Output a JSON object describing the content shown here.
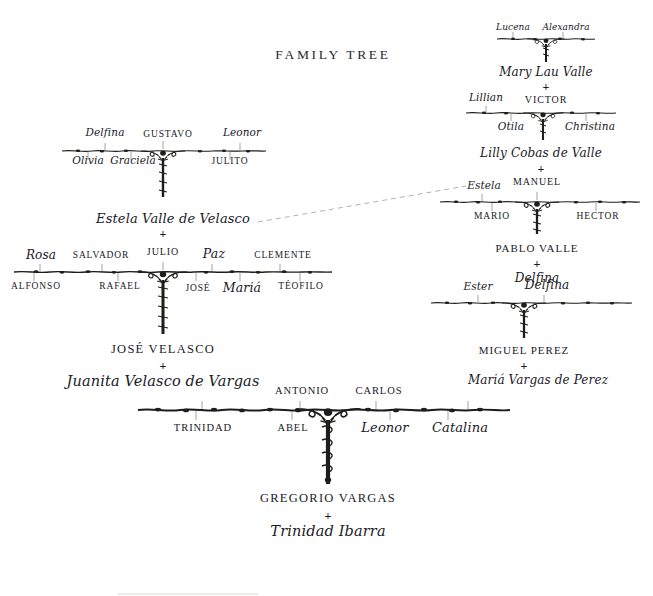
{
  "page": {
    "title": "FAMILY TREE",
    "background": "#ffffff",
    "ink": "#1d1d1b",
    "footer_rule": true
  },
  "family_tree": {
    "type": "genealogy",
    "title": "FAMILY TREE",
    "nodes": [
      {
        "id": "lucena-alexandra-branch",
        "style": "branch",
        "children_above": [
          "Lucena",
          "Alexandra"
        ],
        "children_below": [],
        "issue": "Mary Lau Valle"
      },
      {
        "id": "mary-lau-valle",
        "style": "person",
        "name": "Mary Lau Valle",
        "name_style": "italic",
        "union": "+",
        "spouse": "VICTOR",
        "spouse_style": "caps"
      },
      {
        "id": "victor-branch",
        "style": "branch",
        "children_above": [
          "Lillian"
        ],
        "children_below": [
          "Otila",
          "Christina"
        ],
        "issue": "Lilly Cobas de Valle"
      },
      {
        "id": "lilly-cobas-de-valle",
        "style": "person",
        "name": "Lilly Cobas de Valle",
        "name_style": "italic",
        "union": "+",
        "spouse": "MANUEL",
        "spouse_style": "caps"
      },
      {
        "id": "manuel-branch",
        "style": "branch",
        "children_above": [
          "Estela"
        ],
        "children_below": [
          "MARIO",
          "HECTOR"
        ],
        "issue": "PABLO VALLE"
      },
      {
        "id": "pablo-valle",
        "style": "person",
        "name": "PABLO VALLE",
        "name_style": "caps",
        "union": "+",
        "spouse": "Delfina",
        "spouse_style": "italic"
      },
      {
        "id": "miguel-perez-branch",
        "style": "branch",
        "children_above": [
          "Ester",
          "Delfina"
        ],
        "children_below": [],
        "issue": "MIGUEL PEREZ"
      },
      {
        "id": "miguel-perez",
        "style": "person",
        "name": "MIGUEL PEREZ",
        "name_style": "caps",
        "union": "+",
        "spouse": "Mariá Vargas de Perez",
        "spouse_style": "italic"
      },
      {
        "id": "gustavo-branch",
        "style": "branch",
        "children_above": [
          "Delfina",
          "GUSTAVO",
          "Leonor"
        ],
        "children_below": [
          "Olivia",
          "Graciela",
          "JULITO"
        ],
        "issue": "Estela Valle de Velasco"
      },
      {
        "id": "estela-valle-de-velasco",
        "style": "person",
        "name": "Estela Valle de Velasco",
        "name_style": "italic",
        "union": "+",
        "spouse": "JULIO",
        "spouse_style": "caps"
      },
      {
        "id": "julio-branch",
        "style": "branch",
        "children_above": [
          "Rosa",
          "SALVADOR",
          "JULIO",
          "Paz",
          "CLEMENTE"
        ],
        "children_below": [
          "ALFONSO",
          "RAFAEL",
          "JOSÉ",
          "Mariá",
          "TÉOFILO"
        ],
        "issue": "JOSÉ VELASCO"
      },
      {
        "id": "jose-velasco",
        "style": "person",
        "name": "JOSÉ VELASCO",
        "name_style": "caps",
        "union": "+",
        "spouse": "Juanita Velasco de Vargas",
        "spouse_style": "italic"
      },
      {
        "id": "antonio-carlos-branch",
        "style": "branch",
        "children_above": [
          "ANTONIO",
          "CARLOS"
        ],
        "children_below": [
          "TRINIDAD",
          "ABEL",
          "Leonor",
          "Catalina"
        ],
        "issue": "GREGORIO VARGAS"
      },
      {
        "id": "gregorio-vargas",
        "style": "person",
        "name": "GREGORIO VARGAS",
        "name_style": "caps",
        "union": "+",
        "spouse": "Trinidad Ibarra",
        "spouse_style": "italic"
      }
    ],
    "links": [
      {
        "from": "estela-valle-de-velasco",
        "to": "estela-node-on-manuel-branch",
        "style": "dashed",
        "note": "same person cross-reference"
      }
    ]
  },
  "labels": {
    "title": "FAMILY TREE",
    "plus": "+",
    "lucena": "Lucena",
    "alexandra": "Alexandra",
    "mary_lau_valle": "Mary Lau Valle",
    "victor": "VICTOR",
    "lillian": "Lillian",
    "otila": "Otila",
    "christina": "Christina",
    "lilly_cobas_de_valle": "Lilly Cobas de Valle",
    "manuel": "MANUEL",
    "estela_node": "Estela",
    "mario": "MARIO",
    "hector": "HECTOR",
    "pablo_valle": "PABLO VALLE",
    "delfina_right": "Delfina",
    "ester": "Ester",
    "delfina_perez": "Delfina",
    "miguel_perez": "MIGUEL PEREZ",
    "maria_vargas_de_perez": "Mariá Vargas de Perez",
    "delfina_left": "Delfina",
    "gustavo": "GUSTAVO",
    "leonor_top": "Leonor",
    "olivia": "Olivia",
    "graciela": "Graciela",
    "julito": "JULITO",
    "estela_valle_de_velasco": "Estela Valle de Velasco",
    "rosa": "Rosa",
    "salvador": "SALVADOR",
    "julio": "JULIO",
    "paz": "Paz",
    "clemente": "CLEMENTE",
    "alfonso": "ALFONSO",
    "rafael": "RAFAEL",
    "jose_child": "JOSÉ",
    "maria_child": "Mariá",
    "teofilo": "TÉOFILO",
    "jose_velasco": "JOSÉ VELASCO",
    "juanita_velasco_de_vargas": "Juanita Velasco de Vargas",
    "antonio": "ANTONIO",
    "carlos": "CARLOS",
    "trinidad": "TRINIDAD",
    "abel": "ABEL",
    "leonor_bottom": "Leonor",
    "catalina": "Catalina",
    "gregorio_vargas": "GREGORIO VARGAS",
    "trinidad_ibarra": "Trinidad Ibarra"
  }
}
